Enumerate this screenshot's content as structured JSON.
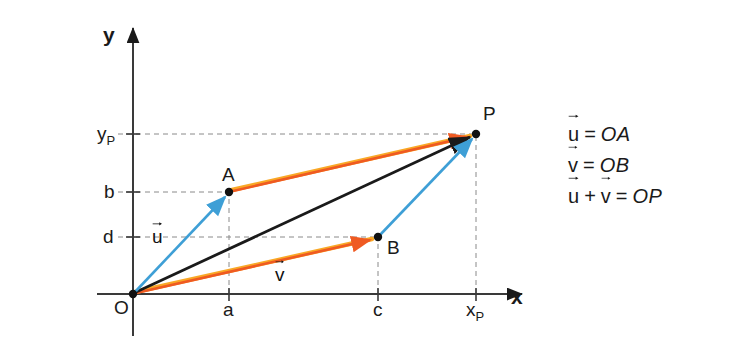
{
  "credit": {
    "text": "Banco de imagens/Arquivo da editora"
  },
  "axes": {
    "x_label": "x",
    "y_label": "y",
    "origin_label": "O"
  },
  "x_ticks": [
    {
      "label": "a",
      "x": 229
    },
    {
      "label": "c",
      "x": 379
    },
    {
      "label": "x",
      "sub": "P",
      "x": 477
    }
  ],
  "y_ticks": [
    {
      "label": "y",
      "sub": "P",
      "y": 134
    },
    {
      "label": "b",
      "y": 192
    },
    {
      "label": "d",
      "y": 237
    }
  ],
  "points": [
    {
      "label": "A",
      "x": 229,
      "y": 192
    },
    {
      "label": "B",
      "x": 378,
      "y": 237
    },
    {
      "label": "P",
      "x": 476,
      "y": 134
    }
  ],
  "vectors": [
    {
      "name": "u",
      "label": "u",
      "from": "O",
      "to": "A",
      "color": "#3e9fd6"
    },
    {
      "name": "v",
      "label": "v",
      "from": "O",
      "to": "B",
      "color": "#ef5a22"
    },
    {
      "name": "OP",
      "label": "",
      "from": "O",
      "to": "P",
      "color": "#1a1a1a"
    }
  ],
  "vector_labels": [
    {
      "label": "u",
      "x": 152,
      "y": 226
    },
    {
      "label": "v",
      "x": 275,
      "y": 264
    }
  ],
  "equations": [
    {
      "lhs": [
        "u"
      ],
      "rhs": "OA"
    },
    {
      "lhs": [
        "v"
      ],
      "rhs": "OB"
    },
    {
      "lhs": [
        "u",
        "+",
        "v"
      ],
      "rhs": "OP"
    }
  ],
  "equation_text": [
    "u⃗ = OA",
    "v⃗ = OB",
    "u⃗ + v⃗ = OP"
  ],
  "colors": {
    "blue": "#3e9fd6",
    "orange": "#ef5a22",
    "orange_hi": "#f9a826",
    "black": "#1a1a1a",
    "dashed": "#8a8a8a",
    "credit_gray": "#6b6b6b"
  },
  "geometry": {
    "origin": {
      "x": 133,
      "y": 294
    },
    "x_axis_end": {
      "x": 528,
      "y": 294
    },
    "y_axis_top": {
      "x": 133,
      "y": 22
    },
    "y_axis_bottom": {
      "x": 133,
      "y": 336
    }
  }
}
